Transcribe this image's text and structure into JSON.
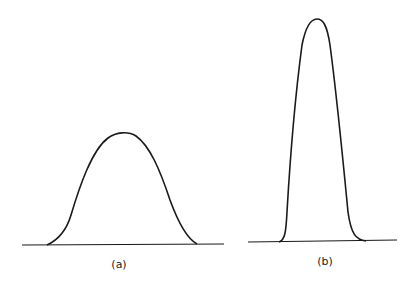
{
  "figure": {
    "panels": [
      {
        "label": "(a)",
        "description": "wide, low bell-shaped curve"
      },
      {
        "label": "(b)",
        "description": "narrow, tall bell-shaped curve"
      }
    ]
  },
  "colors": {
    "stroke": "#1a1a1a",
    "background": "#ffffff"
  }
}
